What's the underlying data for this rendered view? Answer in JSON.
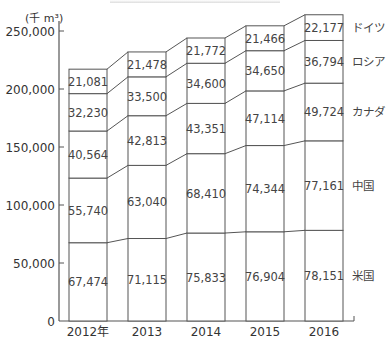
{
  "chart_data": {
    "type": "bar",
    "stacked": true,
    "title": "",
    "unit_label": "(千 m³)",
    "xlabel": "",
    "ylabel": "(千 m³)",
    "ylim": [
      0,
      250000
    ],
    "yticks": [
      0,
      50000,
      100000,
      150000,
      200000,
      250000
    ],
    "ytick_labels": [
      "0",
      "50,000",
      "100,000",
      "150,000",
      "200,000",
      "250,000"
    ],
    "categories": [
      "2012年",
      "2013",
      "2014",
      "2015",
      "2016"
    ],
    "series": [
      {
        "name": "米国",
        "values": [
          67474,
          71115,
          75833,
          76904,
          78151
        ]
      },
      {
        "name": "中国",
        "values": [
          55740,
          63040,
          68410,
          74344,
          77161
        ]
      },
      {
        "name": "カナダ",
        "values": [
          40564,
          42813,
          43351,
          47114,
          49724
        ]
      },
      {
        "name": "ロシア",
        "values": [
          32230,
          33500,
          34600,
          34650,
          36794
        ]
      },
      {
        "name": "ドイツ",
        "values": [
          21081,
          21478,
          21772,
          21466,
          22177
        ]
      }
    ],
    "value_labels": [
      [
        "67,474",
        "71,115",
        "75,833",
        "76,904",
        "78,151"
      ],
      [
        "55,740",
        "63,040",
        "68,410",
        "74,344",
        "77,161"
      ],
      [
        "40,564",
        "42,813",
        "43,351",
        "47,114",
        "49,724"
      ],
      [
        "32,230",
        "33,500",
        "34,600",
        "34,650",
        "36,794"
      ],
      [
        "21,081",
        "21,478",
        "21,772",
        "21,466",
        "22,177"
      ]
    ],
    "legend_position": "right (labels beside last bar)",
    "grid": false,
    "connector_lines": true
  }
}
